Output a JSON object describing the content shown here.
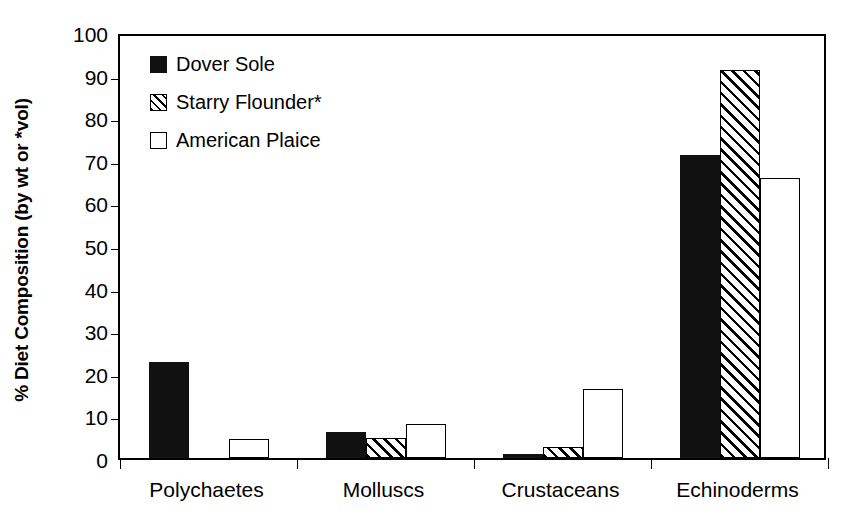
{
  "chart_data": {
    "type": "bar",
    "title": "",
    "xlabel": "",
    "ylabel": "% Diet Composition (by wt or *vol)",
    "categories": [
      "Polychaetes",
      "Molluscs",
      "Crustaceans",
      "Echinoderms"
    ],
    "series": [
      {
        "name": "Dover Sole",
        "style": "solid",
        "values": [
          22.5,
          6.0,
          1.0,
          71.2
        ]
      },
      {
        "name": "Starry Flounder*",
        "style": "hatch",
        "values": [
          0.0,
          4.8,
          2.5,
          91.2
        ]
      },
      {
        "name": "American Plaice",
        "style": "open",
        "values": [
          4.4,
          7.9,
          16.3,
          65.7
        ]
      }
    ],
    "ylim": [
      0,
      100
    ],
    "yticks": [
      0,
      10,
      20,
      30,
      40,
      50,
      60,
      70,
      80,
      90,
      100
    ],
    "ytick_labels": [
      "0",
      "10",
      "20",
      "30",
      "40",
      "50",
      "60",
      "70",
      "80",
      "90",
      "100"
    ],
    "grid": false,
    "legend_position": "top-left",
    "legend_entries": [
      "Dover Sole",
      "Starry Flounder*",
      "American Plaice"
    ],
    "colors": {
      "dover_sole": "#111111",
      "starry_flounder": "#ffffff",
      "american_plaice": "#ffffff",
      "axis": "#000000"
    }
  }
}
